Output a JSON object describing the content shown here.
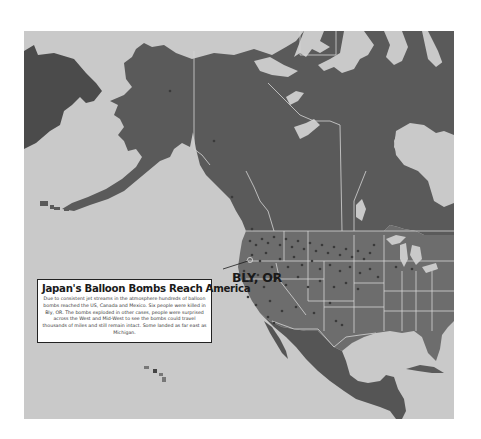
{
  "map": {
    "colors": {
      "ocean": "#c9c9c9",
      "russia": "#4b4b4b",
      "canada_alaska": "#5a5a5a",
      "usa": "#6d6d6d",
      "mexico_central_america": "#555555",
      "borders": "#d6d6d6",
      "bomb_markers": "#3a3a3a"
    },
    "regions": [
      "Russia (Chukotka)",
      "Alaska",
      "Canada",
      "Greenland",
      "United States",
      "Mexico",
      "Central America",
      "Cuba",
      "Hawaii"
    ]
  },
  "infobox": {
    "title": "Japan's Balloon Bombs Reach America",
    "body": "Due to consistent jet streams in the atmosphere hundreds of balloon bombs reached the US, Canada and Mexico. Six people were killed in Bly, OR. The bombs exploded in other cases, people were surprised across the West and Mid-West to see the bombs could travel thousands of miles and still remain intact. Some landed as far east as Michigan."
  },
  "callout": {
    "label": "BLY, OR"
  }
}
